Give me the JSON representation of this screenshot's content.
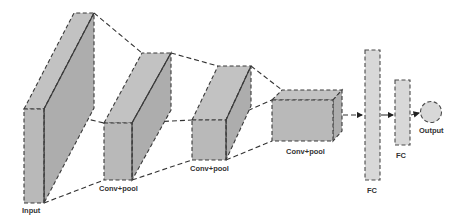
{
  "diagram": {
    "colors": {
      "block_fill": "#b9b9b9",
      "fc_fill": "#d8d8d8",
      "stroke": "#3a3a3a",
      "background": "#ffffff"
    },
    "layers": [
      {
        "id": "input",
        "label": "Input"
      },
      {
        "id": "conv1",
        "label": "Conv+pool"
      },
      {
        "id": "conv2",
        "label": "Conv+pool"
      },
      {
        "id": "conv3",
        "label": "Conv+pool"
      },
      {
        "id": "fc1",
        "label": "FC"
      },
      {
        "id": "fc2",
        "label": "FC"
      },
      {
        "id": "output",
        "label": "Output"
      }
    ],
    "edges": [
      {
        "from": "input",
        "to": "conv1",
        "style": "dashed-projection"
      },
      {
        "from": "conv1",
        "to": "conv2",
        "style": "dashed-projection"
      },
      {
        "from": "conv2",
        "to": "conv3",
        "style": "dashed-projection"
      },
      {
        "from": "conv3",
        "to": "fc1",
        "style": "dashed-arrow"
      },
      {
        "from": "fc1",
        "to": "fc2",
        "style": "arrow"
      },
      {
        "from": "fc2",
        "to": "output",
        "style": "arrow"
      }
    ]
  }
}
